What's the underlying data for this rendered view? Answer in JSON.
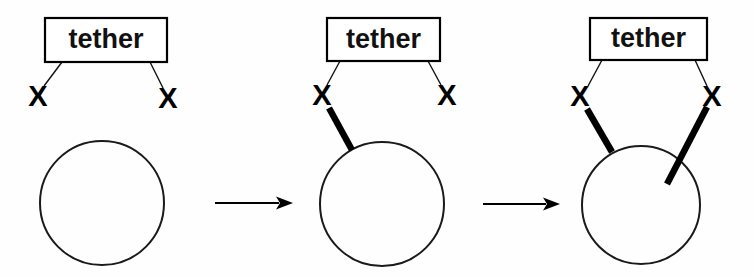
{
  "figure": {
    "background_color": "#fefefe",
    "ink_color": "#000000",
    "width": 754,
    "height": 276,
    "panel_count": 3,
    "arrow_count": 2
  },
  "labels": {
    "tether": "tether",
    "x_mark": "X"
  },
  "panels": [
    {
      "id": "panel-1",
      "stage": "unbound",
      "box": {
        "label": "tether",
        "x": 45,
        "y": 18,
        "width": 122,
        "height": 44
      },
      "x_marks": [
        {
          "id": "x-left",
          "label": "X",
          "cx": 38,
          "cy": 98
        },
        {
          "id": "x-right",
          "label": "X",
          "cx": 168,
          "cy": 100
        }
      ],
      "links": [
        {
          "from": [
            62,
            62
          ],
          "to": [
            44,
            86
          ]
        },
        {
          "from": [
            150,
            62
          ],
          "to": [
            163,
            88
          ]
        }
      ],
      "circle": {
        "cx": 102,
        "cy": 203,
        "r": 62
      },
      "bars": []
    },
    {
      "id": "panel-2",
      "stage": "one-attachment",
      "box": {
        "label": "tether",
        "x": 327,
        "y": 18,
        "width": 113,
        "height": 43
      },
      "x_marks": [
        {
          "id": "x-left",
          "label": "X",
          "cx": 322,
          "cy": 97
        },
        {
          "id": "x-right",
          "label": "X",
          "cx": 447,
          "cy": 97
        }
      ],
      "links": [
        {
          "from": [
            340,
            61
          ],
          "to": [
            327,
            85
          ]
        },
        {
          "from": [
            428,
            61
          ],
          "to": [
            441,
            85
          ]
        }
      ],
      "circle": {
        "cx": 382,
        "cy": 204,
        "r": 62
      },
      "bars": [
        {
          "id": "bar-left",
          "from": [
            329,
            108
          ],
          "to": [
            352,
            150
          ]
        }
      ]
    },
    {
      "id": "panel-3",
      "stage": "two-attachments",
      "box": {
        "label": "tether",
        "x": 590,
        "y": 18,
        "width": 117,
        "height": 42
      },
      "x_marks": [
        {
          "id": "x-left",
          "label": "X",
          "cx": 580,
          "cy": 98
        },
        {
          "id": "x-right",
          "label": "X",
          "cx": 712,
          "cy": 98
        }
      ],
      "links": [
        {
          "from": [
            602,
            60
          ],
          "to": [
            588,
            86
          ]
        },
        {
          "from": [
            695,
            60
          ],
          "to": [
            707,
            86
          ]
        }
      ],
      "circle": {
        "cx": 641,
        "cy": 205,
        "r": 59
      },
      "bars": [
        {
          "id": "bar-left",
          "from": [
            587,
            109
          ],
          "to": [
            612,
            152
          ]
        },
        {
          "id": "bar-right",
          "from": [
            707,
            107
          ],
          "to": [
            667,
            184
          ]
        }
      ]
    }
  ],
  "arrows": [
    {
      "id": "arrow-1",
      "x1": 215,
      "y1": 203,
      "x2": 293,
      "y2": 203
    },
    {
      "id": "arrow-2",
      "x1": 483,
      "y1": 204,
      "x2": 560,
      "y2": 204
    }
  ]
}
